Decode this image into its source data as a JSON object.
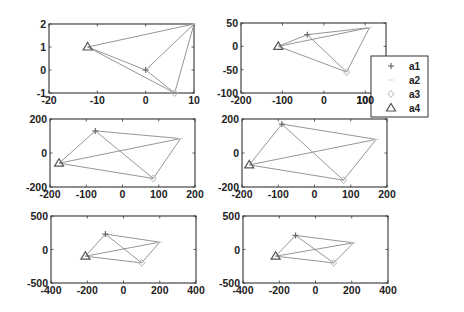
{
  "figure": {
    "width": 464,
    "height": 312,
    "background": "#ffffff",
    "axis_color": "#333333",
    "line_color": "#8a8a8a"
  },
  "legend": {
    "box": {
      "x": 371,
      "y": 56,
      "w": 57,
      "h": 61
    },
    "entries": [
      {
        "label": "a1",
        "marker": "plus",
        "color": "#6a6a6a"
      },
      {
        "label": "a2",
        "marker": "dash",
        "color": "#cfcfcf"
      },
      {
        "label": "a3",
        "marker": "diamond",
        "color": "#b5b5b5"
      },
      {
        "label": "a4",
        "marker": "triangle",
        "color": "#555555"
      }
    ]
  },
  "chart_data": [
    {
      "type": "line",
      "title": "",
      "position": {
        "x": 49,
        "y": 24,
        "w": 145,
        "h": 69
      },
      "xlim": [
        -20,
        10
      ],
      "ylim": [
        -1,
        2
      ],
      "xticks": [
        -20,
        -10,
        0,
        10
      ],
      "yticks": [
        -1,
        0,
        1,
        2
      ],
      "grid": false,
      "points": {
        "a1": [
          0,
          0
        ],
        "a2": [
          10,
          2
        ],
        "a3": [
          6,
          -1
        ],
        "a4": [
          -12,
          1
        ]
      },
      "edges": [
        [
          "a4",
          "a2"
        ],
        [
          "a4",
          "a1"
        ],
        [
          "a4",
          "a3"
        ],
        [
          "a1",
          "a2"
        ],
        [
          "a2",
          "a3"
        ],
        [
          "a1",
          "a3"
        ]
      ]
    },
    {
      "type": "line",
      "title": "",
      "position": {
        "x": 241,
        "y": 23,
        "w": 145,
        "h": 70
      },
      "xlim": [
        -200,
        150
      ],
      "ylim": [
        -100,
        50
      ],
      "xticks": [
        -200,
        -100,
        0,
        100
      ],
      "yticks": [
        -100,
        -50,
        0,
        50
      ],
      "grid": false,
      "points": {
        "a1": [
          -40,
          25
        ],
        "a2": [
          110,
          40
        ],
        "a3": [
          55,
          -55
        ],
        "a4": [
          -110,
          0
        ]
      },
      "edges": [
        [
          "a4",
          "a1"
        ],
        [
          "a1",
          "a2"
        ],
        [
          "a4",
          "a2"
        ],
        [
          "a2",
          "a3"
        ],
        [
          "a3",
          "a4"
        ],
        [
          "a1",
          "a3"
        ]
      ]
    },
    {
      "type": "line",
      "title": "",
      "position": {
        "x": 50,
        "y": 119,
        "w": 145,
        "h": 68
      },
      "xlim": [
        -200,
        200
      ],
      "ylim": [
        -200,
        200
      ],
      "xticks": [
        -200,
        -100,
        0,
        100,
        200
      ],
      "yticks": [
        -200,
        0,
        200
      ],
      "grid": false,
      "points": {
        "a1": [
          -75,
          130
        ],
        "a2": [
          160,
          85
        ],
        "a3": [
          85,
          -150
        ],
        "a4": [
          -175,
          -60
        ]
      },
      "edges": [
        [
          "a4",
          "a1"
        ],
        [
          "a1",
          "a2"
        ],
        [
          "a2",
          "a3"
        ],
        [
          "a3",
          "a4"
        ],
        [
          "a4",
          "a2"
        ],
        [
          "a1",
          "a3"
        ]
      ]
    },
    {
      "type": "line",
      "title": "",
      "position": {
        "x": 242,
        "y": 119,
        "w": 145,
        "h": 68
      },
      "xlim": [
        -200,
        200
      ],
      "ylim": [
        -200,
        200
      ],
      "xticks": [
        -200,
        -100,
        0,
        100,
        200
      ],
      "yticks": [
        -200,
        0,
        200
      ],
      "grid": false,
      "points": {
        "a1": [
          -90,
          170
        ],
        "a2": [
          170,
          80
        ],
        "a3": [
          80,
          -160
        ],
        "a4": [
          -180,
          -70
        ]
      },
      "edges": [
        [
          "a4",
          "a1"
        ],
        [
          "a1",
          "a2"
        ],
        [
          "a2",
          "a3"
        ],
        [
          "a3",
          "a4"
        ],
        [
          "a4",
          "a2"
        ],
        [
          "a1",
          "a3"
        ]
      ]
    },
    {
      "type": "line",
      "title": "",
      "position": {
        "x": 51,
        "y": 216,
        "w": 145,
        "h": 67
      },
      "xlim": [
        -400,
        400
      ],
      "ylim": [
        -500,
        500
      ],
      "xticks": [
        -400,
        -200,
        0,
        200,
        400
      ],
      "yticks": [
        -500,
        0,
        500
      ],
      "grid": false,
      "points": {
        "a1": [
          -100,
          230
        ],
        "a2": [
          200,
          110
        ],
        "a3": [
          100,
          -200
        ],
        "a4": [
          -210,
          -100
        ]
      },
      "edges": [
        [
          "a4",
          "a1"
        ],
        [
          "a1",
          "a2"
        ],
        [
          "a2",
          "a3"
        ],
        [
          "a3",
          "a4"
        ],
        [
          "a4",
          "a2"
        ],
        [
          "a1",
          "a3"
        ]
      ]
    },
    {
      "type": "line",
      "title": "",
      "position": {
        "x": 243,
        "y": 216,
        "w": 145,
        "h": 67
      },
      "xlim": [
        -400,
        400
      ],
      "ylim": [
        -500,
        500
      ],
      "xticks": [
        -400,
        -200,
        0,
        200,
        400
      ],
      "yticks": [
        -500,
        0,
        500
      ],
      "grid": false,
      "points": {
        "a1": [
          -110,
          210
        ],
        "a2": [
          210,
          100
        ],
        "a3": [
          100,
          -200
        ],
        "a4": [
          -220,
          -100
        ]
      },
      "edges": [
        [
          "a4",
          "a1"
        ],
        [
          "a1",
          "a2"
        ],
        [
          "a2",
          "a3"
        ],
        [
          "a3",
          "a4"
        ],
        [
          "a4",
          "a2"
        ],
        [
          "a1",
          "a3"
        ]
      ]
    }
  ]
}
